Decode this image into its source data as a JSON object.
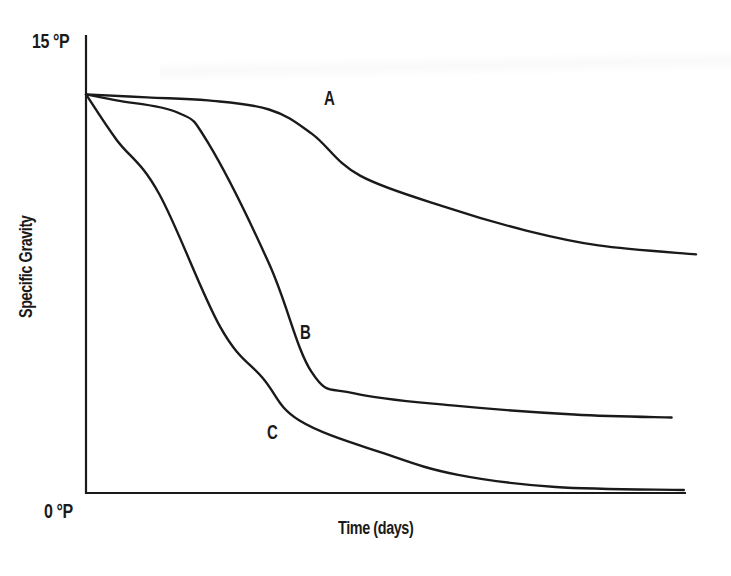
{
  "chart_data": {
    "type": "line",
    "title": "",
    "xlabel": "Time (days)",
    "ylabel": "Specific Gravity",
    "y_ticks": [
      "15 °P",
      "0 °P"
    ],
    "ylim": [
      0,
      15
    ],
    "x_ticks": [],
    "grid": false,
    "legend": "none (curves labeled inline A, B, C)",
    "x_units": "relative time (0–100, no tick values shown)",
    "series": [
      {
        "name": "A",
        "x": [
          0,
          10,
          20,
          30,
          37,
          45,
          60,
          72,
          84,
          100
        ],
        "values": [
          13.2,
          13.1,
          13.0,
          12.7,
          11.9,
          10.5,
          9.4,
          8.7,
          8.2,
          7.9
        ]
      },
      {
        "name": "B",
        "x": [
          0,
          5,
          15,
          20,
          30,
          37,
          44,
          60,
          80,
          96
        ],
        "values": [
          13.2,
          13.0,
          12.6,
          11.6,
          7.6,
          4.0,
          3.3,
          2.9,
          2.6,
          2.5
        ]
      },
      {
        "name": "C",
        "x": [
          0,
          5,
          12,
          22,
          29,
          35,
          49,
          61,
          77,
          98
        ],
        "values": [
          13.2,
          11.7,
          9.9,
          5.5,
          3.8,
          2.4,
          1.3,
          0.6,
          0.2,
          0.1
        ]
      }
    ]
  },
  "labels": {
    "y_top": "15 °P",
    "y_bottom": "0 °P",
    "x_axis": "Time (days)",
    "y_axis": "Specific Gravity",
    "curve_a": "A",
    "curve_b": "B",
    "curve_c": "C"
  },
  "colors": {
    "ink": "#1a1a1a",
    "background": "#ffffff"
  }
}
